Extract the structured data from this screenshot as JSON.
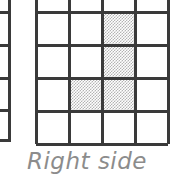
{
  "figure": {
    "caption": "Right side",
    "caption_color": "#8c8c8c",
    "background_color": "#ffffff",
    "line_color": "#3a3a3a",
    "shade_color": "#b4b4b4"
  },
  "left_fragment": {
    "name": "partial-grid-fragment",
    "vertical_line_x": 8,
    "horizontal_stub_y": [
      12,
      45,
      78,
      110,
      141
    ]
  },
  "grid": {
    "columns": 4,
    "rows": 5,
    "cell_width": 33,
    "cell_height": 33,
    "left": 36,
    "right": 168,
    "bottom": 141,
    "row_line_y": [
      12,
      45,
      78,
      110,
      141
    ],
    "column_line_x": [
      36,
      69,
      102,
      135,
      168
    ],
    "top_row_clipped": true,
    "cells": [
      {
        "row": 1,
        "col": 1,
        "shaded": false
      },
      {
        "row": 1,
        "col": 2,
        "shaded": false
      },
      {
        "row": 1,
        "col": 3,
        "shaded": false
      },
      {
        "row": 1,
        "col": 4,
        "shaded": false
      },
      {
        "row": 2,
        "col": 1,
        "shaded": false
      },
      {
        "row": 2,
        "col": 2,
        "shaded": false
      },
      {
        "row": 2,
        "col": 3,
        "shaded": true
      },
      {
        "row": 2,
        "col": 4,
        "shaded": false
      },
      {
        "row": 3,
        "col": 1,
        "shaded": false
      },
      {
        "row": 3,
        "col": 2,
        "shaded": false
      },
      {
        "row": 3,
        "col": 3,
        "shaded": true
      },
      {
        "row": 3,
        "col": 4,
        "shaded": false
      },
      {
        "row": 4,
        "col": 1,
        "shaded": false
      },
      {
        "row": 4,
        "col": 2,
        "shaded": true
      },
      {
        "row": 4,
        "col": 3,
        "shaded": true
      },
      {
        "row": 4,
        "col": 4,
        "shaded": false
      },
      {
        "row": 5,
        "col": 1,
        "shaded": false
      },
      {
        "row": 5,
        "col": 2,
        "shaded": false
      },
      {
        "row": 5,
        "col": 3,
        "shaded": false
      },
      {
        "row": 5,
        "col": 4,
        "shaded": false
      }
    ]
  }
}
